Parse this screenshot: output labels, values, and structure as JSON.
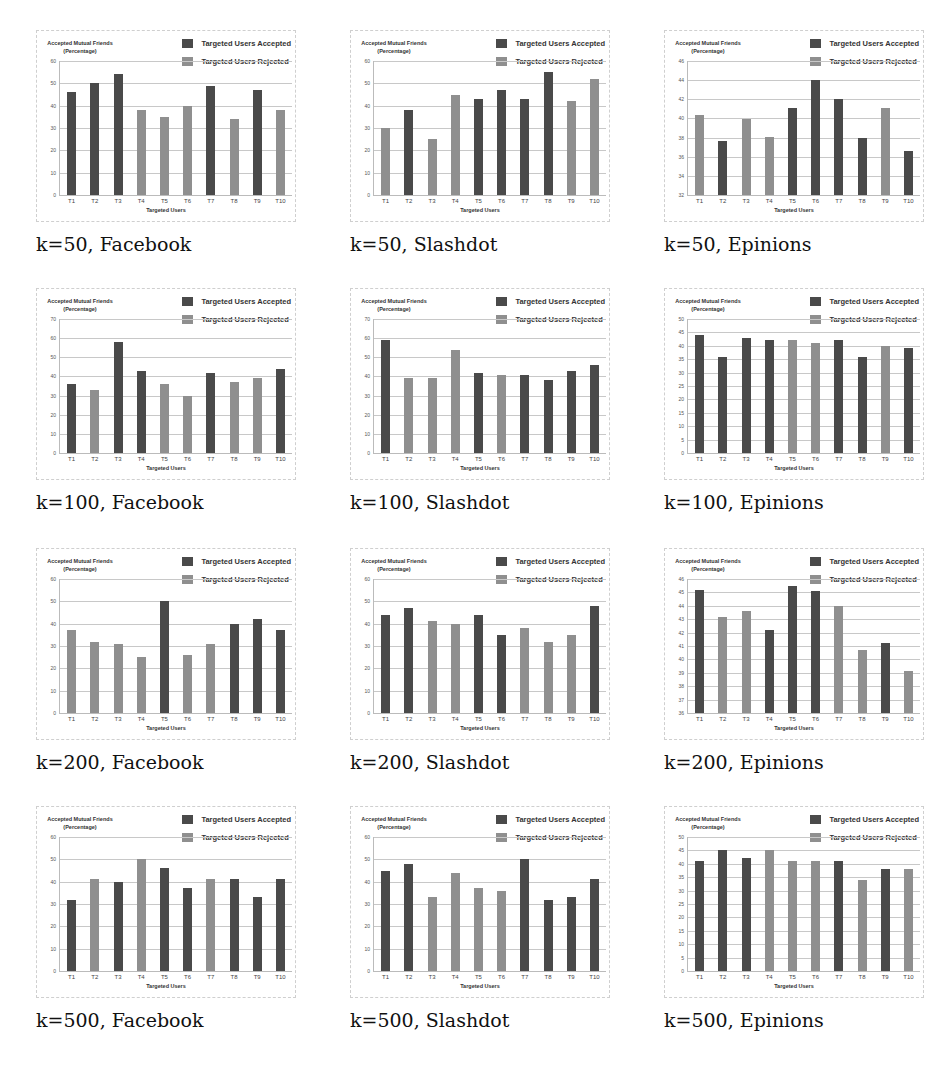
{
  "legend": {
    "accepted": "Targeted Users Accepted",
    "rejected": "Targeted Users Rejected"
  },
  "colors": {
    "accepted": "#4a4a4a",
    "rejected": "#8f8f8f"
  },
  "common": {
    "ylabel_line1": "Accepted Mutual Friends",
    "ylabel_line2": "(Percentage)",
    "xlabel": "Targeted Users"
  },
  "chart_data": [
    {
      "type": "bar",
      "caption": "k=50, Facebook",
      "xlabel": "Targeted Users",
      "ylabel": "Accepted Mutual Friends (Percentage)",
      "ylim": [
        0,
        60
      ],
      "yticks": [
        0,
        10,
        20,
        30,
        40,
        50,
        60
      ],
      "categories": [
        "T1",
        "T2",
        "T3",
        "T4",
        "T5",
        "T6",
        "T7",
        "T8",
        "T9",
        "T10"
      ],
      "values": [
        46,
        50,
        54,
        38,
        35,
        40,
        49,
        34,
        47,
        38
      ],
      "status": [
        "accepted",
        "accepted",
        "accepted",
        "rejected",
        "rejected",
        "rejected",
        "accepted",
        "rejected",
        "accepted",
        "rejected"
      ]
    },
    {
      "type": "bar",
      "caption": "k=50, Slashdot",
      "xlabel": "Targeted Users",
      "ylabel": "Accepted Mutual Friends (Percentage)",
      "ylim": [
        0,
        60
      ],
      "yticks": [
        0,
        10,
        20,
        30,
        40,
        50,
        60
      ],
      "categories": [
        "T1",
        "T2",
        "T3",
        "T4",
        "T5",
        "T6",
        "T7",
        "T8",
        "T9",
        "T10"
      ],
      "values": [
        30,
        38,
        25,
        45,
        43,
        47,
        43,
        55,
        42,
        52
      ],
      "status": [
        "rejected",
        "accepted",
        "rejected",
        "rejected",
        "accepted",
        "accepted",
        "accepted",
        "accepted",
        "rejected",
        "rejected"
      ]
    },
    {
      "type": "bar",
      "caption": "k=50, Epinions",
      "xlabel": "Targeted Users",
      "ylabel": "Accepted Mutual Friends (Percentage)",
      "ylim": [
        32,
        46
      ],
      "yticks": [
        32,
        34,
        36,
        38,
        40,
        42,
        44,
        46
      ],
      "categories": [
        "T1",
        "T2",
        "T3",
        "T4",
        "T5",
        "T6",
        "T7",
        "T8",
        "T9",
        "T10"
      ],
      "values": [
        40.4,
        37.6,
        39.9,
        38.1,
        41.1,
        44,
        42,
        38,
        41.1,
        36.6
      ],
      "status": [
        "rejected",
        "accepted",
        "rejected",
        "rejected",
        "accepted",
        "accepted",
        "accepted",
        "accepted",
        "rejected",
        "accepted"
      ]
    },
    {
      "type": "bar",
      "caption": "k=100, Facebook",
      "xlabel": "Targeted Users",
      "ylabel": "Accepted Mutual Friends (Percentage)",
      "ylim": [
        0,
        70
      ],
      "yticks": [
        0,
        10,
        20,
        30,
        40,
        50,
        60,
        70
      ],
      "categories": [
        "T1",
        "T2",
        "T3",
        "T4",
        "T5",
        "T6",
        "T7",
        "T8",
        "T9",
        "T10"
      ],
      "values": [
        36,
        33,
        58,
        43,
        36,
        30,
        42,
        37,
        39,
        44
      ],
      "status": [
        "accepted",
        "rejected",
        "accepted",
        "accepted",
        "rejected",
        "rejected",
        "accepted",
        "rejected",
        "rejected",
        "accepted"
      ]
    },
    {
      "type": "bar",
      "caption": "k=100, Slashdot",
      "xlabel": "Targeted Users",
      "ylabel": "Accepted Mutual Friends (Percentage)",
      "ylim": [
        0,
        70
      ],
      "yticks": [
        0,
        10,
        20,
        30,
        40,
        50,
        60,
        70
      ],
      "categories": [
        "T1",
        "T2",
        "T3",
        "T4",
        "T5",
        "T6",
        "T7",
        "T8",
        "T9",
        "T10"
      ],
      "values": [
        59,
        39,
        39,
        54,
        42,
        41,
        41,
        38,
        43,
        46
      ],
      "status": [
        "accepted",
        "rejected",
        "rejected",
        "rejected",
        "accepted",
        "rejected",
        "accepted",
        "accepted",
        "accepted",
        "accepted"
      ]
    },
    {
      "type": "bar",
      "caption": "k=100, Epinions",
      "xlabel": "Targeted Users",
      "ylabel": "Accepted Mutual Friends (Percentage)",
      "ylim": [
        0,
        50
      ],
      "yticks": [
        0,
        5,
        10,
        15,
        20,
        25,
        30,
        35,
        40,
        45,
        50
      ],
      "categories": [
        "T1",
        "T2",
        "T3",
        "T4",
        "T5",
        "T6",
        "T7",
        "T8",
        "T9",
        "T10"
      ],
      "values": [
        44,
        36,
        43,
        42,
        42,
        41,
        42,
        36,
        40,
        39
      ],
      "status": [
        "accepted",
        "accepted",
        "accepted",
        "accepted",
        "rejected",
        "rejected",
        "accepted",
        "accepted",
        "rejected",
        "accepted"
      ]
    },
    {
      "type": "bar",
      "caption": "k=200, Facebook",
      "xlabel": "Targeted Users",
      "ylabel": "Accepted Mutual Friends (Percentage)",
      "ylim": [
        0,
        60
      ],
      "yticks": [
        0,
        10,
        20,
        30,
        40,
        50,
        60
      ],
      "categories": [
        "T1",
        "T2",
        "T3",
        "T4",
        "T5",
        "T6",
        "T7",
        "T8",
        "T9",
        "T10"
      ],
      "values": [
        37,
        32,
        31,
        25,
        50,
        26,
        31,
        40,
        42,
        37
      ],
      "status": [
        "rejected",
        "rejected",
        "rejected",
        "rejected",
        "accepted",
        "rejected",
        "rejected",
        "accepted",
        "accepted",
        "accepted"
      ]
    },
    {
      "type": "bar",
      "caption": "k=200, Slashdot",
      "xlabel": "Targeted Users",
      "ylabel": "Accepted Mutual Friends (Percentage)",
      "ylim": [
        0,
        60
      ],
      "yticks": [
        0,
        10,
        20,
        30,
        40,
        50,
        60
      ],
      "categories": [
        "T1",
        "T2",
        "T3",
        "T4",
        "T5",
        "T6",
        "T7",
        "T8",
        "T9",
        "T10"
      ],
      "values": [
        44,
        47,
        41,
        40,
        44,
        35,
        38,
        32,
        35,
        48
      ],
      "status": [
        "accepted",
        "accepted",
        "rejected",
        "rejected",
        "accepted",
        "accepted",
        "rejected",
        "rejected",
        "rejected",
        "accepted"
      ]
    },
    {
      "type": "bar",
      "caption": "k=200, Epinions",
      "xlabel": "Targeted Users",
      "ylabel": "Accepted Mutual Friends (Percentage)",
      "ylim": [
        36,
        46
      ],
      "yticks": [
        36,
        37,
        38,
        39,
        40,
        41,
        42,
        43,
        44,
        45,
        46
      ],
      "categories": [
        "T1",
        "T2",
        "T3",
        "T4",
        "T5",
        "T6",
        "T7",
        "T8",
        "T9",
        "T10"
      ],
      "values": [
        45.2,
        43.2,
        43.6,
        42.2,
        45.5,
        45.1,
        44,
        40.7,
        41.2,
        39.1
      ],
      "status": [
        "accepted",
        "rejected",
        "rejected",
        "accepted",
        "accepted",
        "accepted",
        "rejected",
        "rejected",
        "accepted",
        "rejected"
      ]
    },
    {
      "type": "bar",
      "caption": "k=500, Facebook",
      "xlabel": "Targeted Users",
      "ylabel": "Accepted Mutual Friends (Percentage)",
      "ylim": [
        0,
        60
      ],
      "yticks": [
        0,
        10,
        20,
        30,
        40,
        50,
        60
      ],
      "categories": [
        "T1",
        "T2",
        "T3",
        "T4",
        "T5",
        "T6",
        "T7",
        "T8",
        "T9",
        "T10"
      ],
      "values": [
        32,
        41,
        40,
        50,
        46,
        37,
        41,
        41,
        33,
        41
      ],
      "status": [
        "accepted",
        "rejected",
        "accepted",
        "rejected",
        "accepted",
        "accepted",
        "rejected",
        "accepted",
        "accepted",
        "accepted"
      ]
    },
    {
      "type": "bar",
      "caption": "k=500, Slashdot",
      "xlabel": "Targeted Users",
      "ylabel": "Accepted Mutual Friends (Percentage)",
      "ylim": [
        0,
        60
      ],
      "yticks": [
        0,
        10,
        20,
        30,
        40,
        50,
        60
      ],
      "categories": [
        "T1",
        "T2",
        "T3",
        "T4",
        "T5",
        "T6",
        "T7",
        "T8",
        "T9",
        "T10"
      ],
      "values": [
        45,
        48,
        33,
        44,
        37,
        36,
        50,
        32,
        33,
        41
      ],
      "status": [
        "accepted",
        "accepted",
        "rejected",
        "rejected",
        "rejected",
        "rejected",
        "accepted",
        "accepted",
        "accepted",
        "accepted"
      ]
    },
    {
      "type": "bar",
      "caption": "k=500, Epinions",
      "xlabel": "Targeted Users",
      "ylabel": "Accepted Mutual Friends (Percentage)",
      "ylim": [
        0,
        50
      ],
      "yticks": [
        0,
        5,
        10,
        15,
        20,
        25,
        30,
        35,
        40,
        45,
        50
      ],
      "categories": [
        "T1",
        "T2",
        "T3",
        "T4",
        "T5",
        "T6",
        "T7",
        "T8",
        "T9",
        "T10"
      ],
      "values": [
        41,
        45,
        42,
        45,
        41,
        41,
        41,
        34,
        38,
        38
      ],
      "status": [
        "accepted",
        "accepted",
        "accepted",
        "rejected",
        "rejected",
        "rejected",
        "accepted",
        "rejected",
        "accepted",
        "rejected"
      ]
    }
  ]
}
